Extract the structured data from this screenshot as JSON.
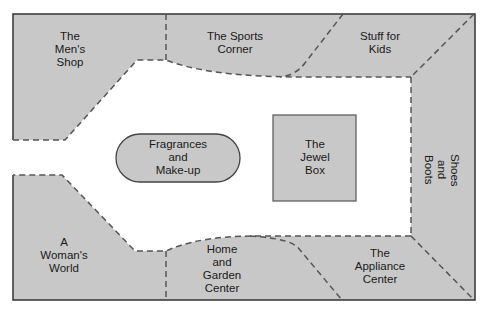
{
  "diagram": {
    "type": "store floor plan",
    "colors": {
      "store_fill": "#c8c8c8",
      "corridor_fill": "#ffffff",
      "border": "#333333",
      "dashed_divider": "#555555"
    },
    "stores": {
      "mens_shop": "The\nMen's\nShop",
      "sports_corner": "The Sports\nCorner",
      "stuff_for_kids": "Stuff for\nKids",
      "shoes_and_boots": "Shoes\nand\nBoots",
      "appliance_center": "The\nAppliance\nCenter",
      "home_and_garden": "Home\nand\nGarden\nCenter",
      "womans_world": "A\nWoman's\nWorld",
      "fragrances": "Fragrances\nand\nMake-up",
      "jewel_box": "The\nJewel\nBox"
    }
  }
}
